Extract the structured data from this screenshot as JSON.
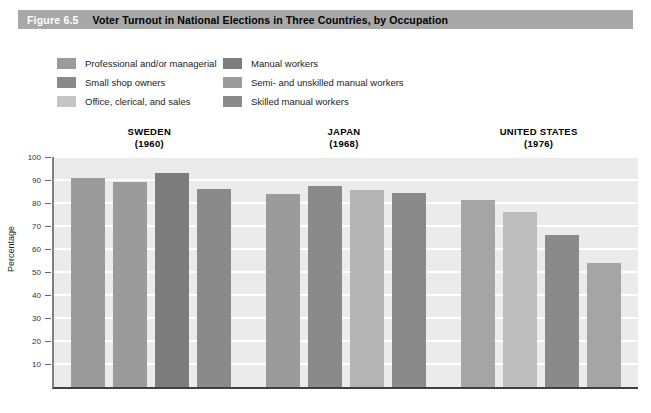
{
  "header": {
    "figure_number": "Figure 6.5",
    "title": "Voter Turnout in National Elections in Three Countries, by Occupation",
    "band_color": "#a8a8a8",
    "number_color": "#ffffff",
    "title_color": "#000000"
  },
  "legend": {
    "columns": [
      {
        "items": [
          {
            "label": "Professional and/or managerial",
            "color": "#9b9b9b"
          },
          {
            "label": "Small shop owners",
            "color": "#8a8a8a"
          },
          {
            "label": "Office, clerical, and sales",
            "color": "#c5c5c5"
          }
        ]
      },
      {
        "items": [
          {
            "label": "Manual workers",
            "color": "#7d7d7d"
          },
          {
            "label": "Semi- and unskilled manual workers",
            "color": "#9b9b9b"
          },
          {
            "label": "Skilled manual workers",
            "color": "#8a8a8a"
          }
        ]
      }
    ]
  },
  "chart_data": {
    "type": "bar",
    "title": "Voter Turnout in National Elections in Three Countries, by Occupation",
    "xlabel": "",
    "ylabel": "Percentage",
    "ylim": [
      0,
      100
    ],
    "yticks": [
      10,
      20,
      30,
      40,
      50,
      60,
      70,
      80,
      90,
      100
    ],
    "ytick_labels": [
      "10",
      "20",
      "30",
      "40",
      "50",
      "60",
      "70",
      "80",
      "90",
      "100"
    ],
    "grid": true,
    "legend_position": "top",
    "groups": [
      {
        "country": "SWEDEN",
        "year": "(1960)",
        "bars": [
          {
            "label": "Professional and/or managerial",
            "value": 91,
            "color": "#9b9b9b"
          },
          {
            "label": "Small shop owners",
            "value": 89,
            "color": "#9b9b9b"
          },
          {
            "label": "Manual workers",
            "value": 93,
            "color": "#7d7d7d"
          },
          {
            "label": "Office, clerical, and sales",
            "value": 86,
            "color": "#8a8a8a"
          }
        ]
      },
      {
        "country": "JAPAN",
        "year": "(1968)",
        "bars": [
          {
            "label": "Professional and/or managerial",
            "value": 84,
            "color": "#9b9b9b"
          },
          {
            "label": "Small shop owners",
            "value": 87.5,
            "color": "#8a8a8a"
          },
          {
            "label": "Office, clerical, and sales",
            "value": 85.5,
            "color": "#b4b4b4"
          },
          {
            "label": "Manual workers",
            "value": 84.5,
            "color": "#8a8a8a"
          }
        ]
      },
      {
        "country": "UNITED STATES",
        "year": "(1976)",
        "bars": [
          {
            "label": "Professional and/or managerial",
            "value": 81.5,
            "color": "#a5a5a5"
          },
          {
            "label": "Office, clerical, and sales",
            "value": 76,
            "color": "#bdbdbd"
          },
          {
            "label": "Skilled manual workers",
            "value": 66,
            "color": "#8a8a8a"
          },
          {
            "label": "Semi- and unskilled manual workers",
            "value": 54,
            "color": "#a5a5a5"
          }
        ]
      }
    ],
    "plot_background": "#ebebeb",
    "gridline_color": "#ffffff"
  }
}
